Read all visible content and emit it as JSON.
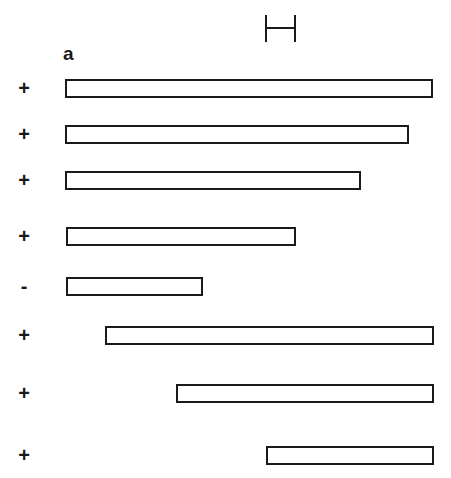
{
  "figure": {
    "panel_label": "a",
    "scale_bar": {
      "x": 265,
      "y": 15,
      "width": 31,
      "height": 27
    },
    "constructs": [
      {
        "sign": "+",
        "left": 65,
        "right": 434,
        "top": 79
      },
      {
        "sign": "+",
        "left": 65,
        "right": 410,
        "top": 125
      },
      {
        "sign": "+",
        "left": 65,
        "right": 362,
        "top": 171
      },
      {
        "sign": "+",
        "left": 66,
        "right": 297,
        "top": 227
      },
      {
        "sign": "-",
        "left": 66,
        "right": 204,
        "top": 277
      },
      {
        "sign": "+",
        "left": 105,
        "right": 435,
        "top": 326
      },
      {
        "sign": "+",
        "left": 176,
        "right": 435,
        "top": 384
      },
      {
        "sign": "+",
        "left": 266,
        "right": 435,
        "top": 446
      }
    ]
  }
}
